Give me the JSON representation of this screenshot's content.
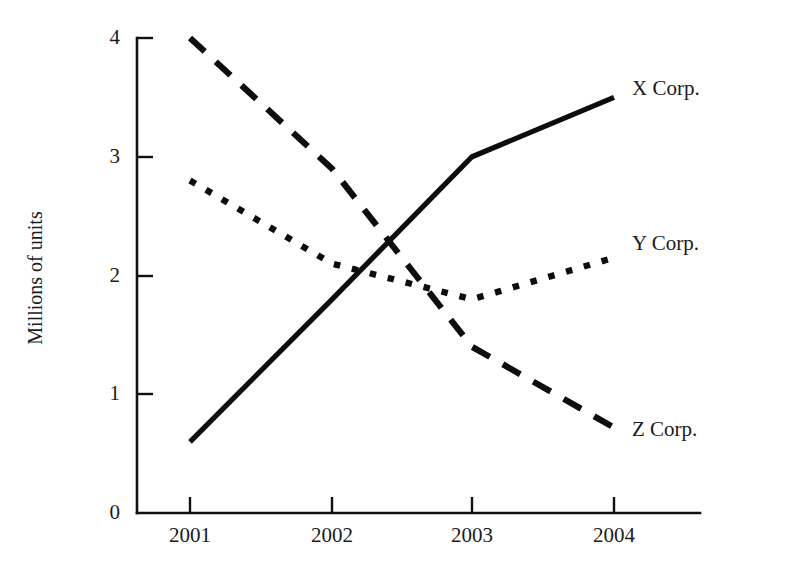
{
  "chart_data": {
    "type": "line",
    "title": "",
    "subtitle": "",
    "xlabel": "",
    "ylabel": "Millions of units",
    "categories": [
      "2001",
      "2002",
      "2003",
      "2004"
    ],
    "x": [
      2001,
      2002,
      2003,
      2004
    ],
    "xlim": [
      2001,
      2004
    ],
    "ylim": [
      0,
      4
    ],
    "yticks": [
      "0",
      "1",
      "2",
      "3",
      "4"
    ],
    "ytick_values": [
      0,
      1,
      2,
      3,
      4
    ],
    "xticks": [
      "2001",
      "2002",
      "2003",
      "2004"
    ],
    "grid": false,
    "legend_position": "right-of-line-ends",
    "series": [
      {
        "name": "X Corp.",
        "style": "solid",
        "color": "#0d0d0d",
        "values": [
          0.6,
          1.8,
          3.0,
          3.5
        ],
        "label": "X Corp."
      },
      {
        "name": "Y Corp.",
        "style": "dotted",
        "color": "#0d0d0d",
        "values": [
          2.8,
          2.1,
          1.8,
          2.15
        ],
        "label": "Y Corp."
      },
      {
        "name": "Z Corp.",
        "style": "dashed",
        "color": "#0d0d0d",
        "values": [
          4.0,
          2.9,
          1.4,
          0.72
        ],
        "label": "Z Corp."
      }
    ],
    "annotations": []
  },
  "axis": {
    "y_title": "Millions of units",
    "y_tick_labels": [
      "4",
      "3",
      "2",
      "1",
      "0"
    ],
    "x_tick_labels": [
      "2001",
      "2002",
      "2003",
      "2004"
    ]
  },
  "labels": {
    "x_corp": "X Corp.",
    "y_corp": "Y Corp.",
    "z_corp": "Z Corp."
  },
  "colors": {
    "ink": "#0d0d0d",
    "text": "#1b1b1b",
    "background": "#ffffff"
  }
}
